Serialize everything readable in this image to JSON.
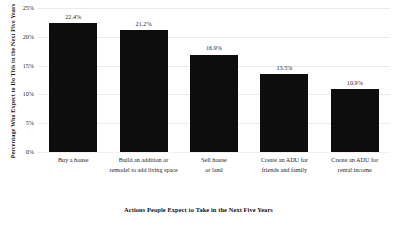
{
  "chart_data": {
    "type": "bar",
    "title": "",
    "xlabel": "Actions People Expect to Take in the Next Five Years",
    "ylabel": "Percentage Who Expect to Do This in the Next Five Years",
    "categories": [
      "Buy a house",
      "Build an addition or remodel to add living space",
      "Sell house or land",
      "Create an ADU for friends and family",
      "Create an ADU for rental income"
    ],
    "category_lines": [
      [
        "Buy a house"
      ],
      [
        "Build an addition or",
        "remodel to add living space"
      ],
      [
        "Sell house",
        "or land"
      ],
      [
        "Create an ADU for",
        "friends and family"
      ],
      [
        "Create an ADU for",
        "rental income"
      ]
    ],
    "values": [
      22.4,
      21.2,
      16.9,
      13.5,
      10.9
    ],
    "value_labels": [
      "22.4%",
      "21.2%",
      "16.9%",
      "13.5%",
      "10.9%"
    ],
    "ylim": [
      0,
      25
    ],
    "ytick_values": [
      25,
      20,
      15,
      10,
      5,
      0
    ],
    "ytick_labels": [
      "25%",
      "20%",
      "15%",
      "10%",
      "5%",
      "0%"
    ],
    "grid": true,
    "legend": false,
    "bar_color": "#0d0d0d",
    "grid_color": "#eceaea",
    "background": "#ffffff"
  }
}
